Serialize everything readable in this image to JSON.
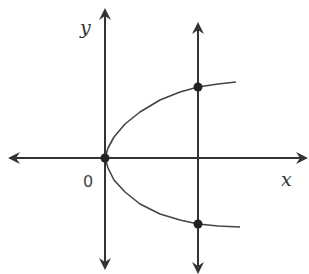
{
  "diagram": {
    "type": "coordinate-plane-graph",
    "colors": {
      "axis": "#333333",
      "curve": "#444444",
      "point": "#222222",
      "background": "#ffffff"
    },
    "labels": {
      "y_axis": "y",
      "x_axis": "x",
      "origin": "0"
    },
    "axes": {
      "origin_px": [
        105,
        158
      ],
      "x_axis": {
        "from_px": [
          10,
          158
        ],
        "to_px": [
          306,
          158
        ],
        "arrows": "both"
      },
      "y_axis": {
        "from_px": [
          105,
          10
        ],
        "to_px": [
          105,
          268
        ],
        "arrows": "both"
      }
    },
    "vertical_line": {
      "x_px": 198,
      "from_y_px": 24,
      "to_y_px": 272,
      "arrows": "both"
    },
    "curve": {
      "shape": "parabola x = a*y^2 (opening right)",
      "points_px": [
        [
          236,
          82
        ],
        [
          218,
          84
        ],
        [
          198,
          87
        ],
        [
          180,
          92
        ],
        [
          160,
          100
        ],
        [
          140,
          112
        ],
        [
          125,
          124
        ],
        [
          114,
          137
        ],
        [
          108,
          148
        ],
        [
          105,
          158
        ],
        [
          108,
          168
        ],
        [
          114,
          180
        ],
        [
          125,
          192
        ],
        [
          140,
          204
        ],
        [
          160,
          214
        ],
        [
          180,
          220
        ],
        [
          198,
          224
        ],
        [
          218,
          226
        ],
        [
          240,
          227
        ]
      ]
    },
    "points": [
      {
        "name": "origin",
        "px": [
          105,
          158
        ]
      },
      {
        "name": "upper-intersection",
        "px": [
          198,
          87
        ]
      },
      {
        "name": "lower-intersection",
        "px": [
          198,
          224
        ]
      }
    ]
  }
}
